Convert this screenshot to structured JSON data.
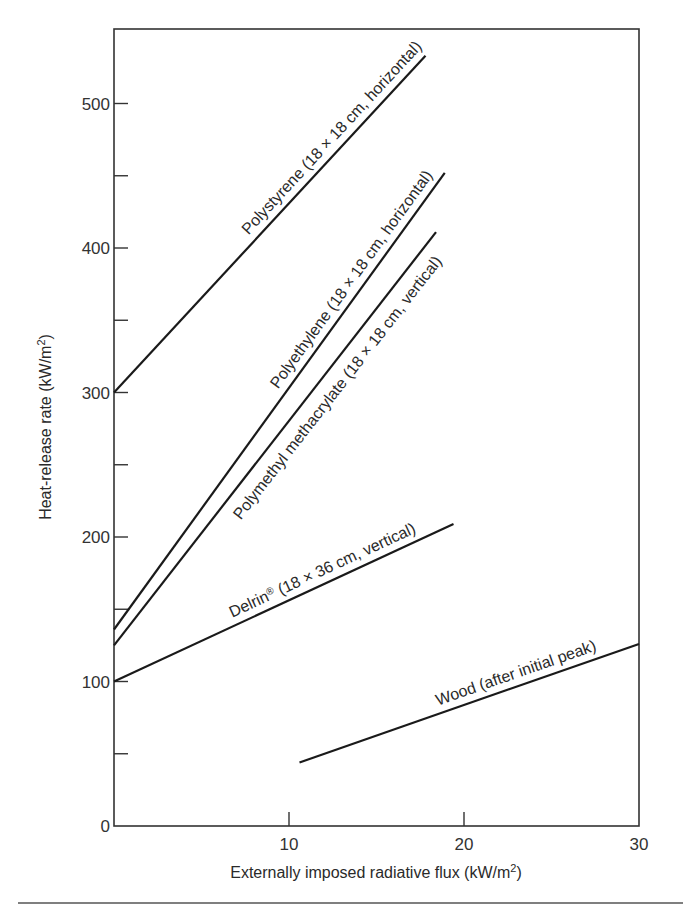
{
  "chart_data": {
    "type": "line",
    "title": "",
    "xlabel": "Externally imposed radiative flux (kW/m²)",
    "ylabel": "Heat-release rate (kW/m²)",
    "xlabel_parts": {
      "text": "Externally imposed radiative flux (kW/m",
      "sup": "2",
      "close": ")"
    },
    "ylabel_parts": {
      "text": "Heat-release rate (kW/m",
      "sup": "2",
      "close": ")"
    },
    "xlim": [
      0,
      30
    ],
    "ylim": [
      0,
      550
    ],
    "x_ticks": [
      0,
      10,
      20,
      30
    ],
    "x_tick_labels": [
      "",
      "10",
      "20",
      "30"
    ],
    "y_ticks": [
      0,
      100,
      200,
      300,
      400,
      500
    ],
    "y_tick_labels": [
      "0",
      "100",
      "200",
      "300",
      "400",
      "500"
    ],
    "y_minor_ticks": [
      50,
      150,
      250,
      350,
      450
    ],
    "grid": false,
    "legend": "inline labels along lines",
    "series": [
      {
        "name": "Polystyrene (18 × 18 cm, horizontal)",
        "x": [
          0,
          17.8
        ],
        "y": [
          300,
          533
        ]
      },
      {
        "name": "Polyethylene (18 × 18 cm, horizontal)",
        "x": [
          0,
          18.9
        ],
        "y": [
          136,
          452
        ]
      },
      {
        "name": "Polymethyl methacrylate (18 × 18 cm, vertical)",
        "x": [
          0,
          18.4
        ],
        "y": [
          125,
          411
        ]
      },
      {
        "name": "Delrin® (18 × 36 cm, vertical)",
        "x": [
          0,
          19.4
        ],
        "y": [
          100,
          209
        ]
      },
      {
        "name": "Wood (after initial peak)",
        "x": [
          10.6,
          30
        ],
        "y": [
          44,
          126
        ]
      }
    ]
  },
  "colors": {
    "line": "#1a1a1a",
    "axis": "#333333",
    "text": "#2a2a2a",
    "background": "#ffffff"
  }
}
